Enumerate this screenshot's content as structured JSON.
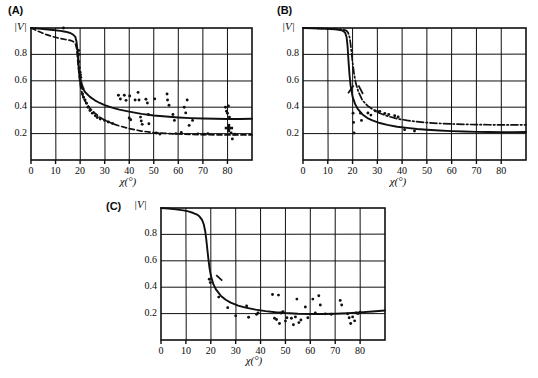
{
  "figure": {
    "background": "#ffffff",
    "ink": "#101010",
    "panels": [
      {
        "id": "A",
        "label": "(A)",
        "ylabel": "|V|",
        "xlabel": "χ(°)"
      },
      {
        "id": "B",
        "label": "(B)",
        "ylabel": "|V|",
        "xlabel": "χ(°)"
      },
      {
        "id": "C",
        "label": "(C)",
        "ylabel": "|V|",
        "xlabel": "χ(°)"
      }
    ]
  },
  "chart_data": [
    {
      "panel": "A",
      "type": "scatter",
      "title": "(A)",
      "xlabel": "χ(°)",
      "ylabel": "|V|",
      "xlim": [
        0,
        90
      ],
      "ylim": [
        0,
        1.0
      ],
      "xticks": [
        0,
        10,
        20,
        30,
        40,
        50,
        60,
        70,
        80
      ],
      "xticklabels": [
        "0",
        "10",
        "20",
        "30",
        "40",
        "50",
        "60",
        "70",
        "80"
      ],
      "yticks": [
        0.2,
        0.4,
        0.6,
        0.8
      ],
      "yticklabels": [
        "0.2",
        "0.4",
        "0.6",
        "0.8"
      ],
      "grid": true,
      "legend": "none",
      "series": [
        {
          "name": "solid-curve",
          "style": "solid",
          "x": [
            0,
            3,
            6,
            9,
            12,
            14,
            16,
            17,
            18,
            18.5,
            19,
            19.3,
            19.6,
            20,
            20.5,
            21,
            22,
            24,
            26,
            28,
            30,
            33,
            36,
            40,
            45,
            50,
            55,
            60,
            65,
            70,
            75,
            80,
            85,
            90
          ],
          "y": [
            1.0,
            0.995,
            0.99,
            0.985,
            0.978,
            0.972,
            0.962,
            0.952,
            0.935,
            0.9,
            0.82,
            0.74,
            0.66,
            0.6,
            0.565,
            0.545,
            0.515,
            0.478,
            0.452,
            0.432,
            0.416,
            0.397,
            0.382,
            0.366,
            0.349,
            0.337,
            0.329,
            0.322,
            0.317,
            0.314,
            0.312,
            0.311,
            0.311,
            0.312
          ]
        },
        {
          "name": "dashed-curve",
          "style": "dashed",
          "x": [
            0,
            3,
            6,
            9,
            12,
            14,
            16,
            17,
            18,
            18.6,
            19,
            19.4,
            19.8,
            20.2,
            21,
            22,
            24,
            26,
            28,
            30,
            33,
            36,
            40,
            45,
            50,
            55,
            60,
            65,
            70,
            75,
            80,
            85,
            90
          ],
          "y": [
            1.0,
            0.975,
            0.952,
            0.934,
            0.92,
            0.913,
            0.906,
            0.9,
            0.885,
            0.845,
            0.76,
            0.68,
            0.61,
            0.555,
            0.49,
            0.447,
            0.392,
            0.355,
            0.325,
            0.302,
            0.277,
            0.258,
            0.238,
            0.219,
            0.208,
            0.201,
            0.197,
            0.194,
            0.192,
            0.191,
            0.19,
            0.19,
            0.19
          ]
        },
        {
          "name": "scatter-points",
          "style": "points",
          "marker": "dot",
          "points": [
            [
              13.2,
              1.0
            ],
            [
              19.4,
              0.83
            ],
            [
              19.6,
              0.8
            ],
            [
              19.5,
              0.745
            ],
            [
              19.7,
              0.7
            ],
            [
              20.0,
              0.665
            ],
            [
              20.2,
              0.645
            ],
            [
              20.3,
              0.625
            ],
            [
              20.1,
              0.605
            ],
            [
              20.4,
              0.585
            ],
            [
              20.6,
              0.57
            ],
            [
              20.9,
              0.555
            ],
            [
              21.2,
              0.54
            ],
            [
              21.0,
              0.5
            ],
            [
              21.4,
              0.475
            ],
            [
              22.0,
              0.455
            ],
            [
              22.6,
              0.43
            ],
            [
              23.2,
              0.4
            ],
            [
              24.0,
              0.375
            ],
            [
              25.0,
              0.355
            ],
            [
              26.2,
              0.335
            ],
            [
              27.0,
              0.322
            ],
            [
              28.2,
              0.31
            ],
            [
              30.0,
              0.3
            ],
            [
              31.5,
              0.288
            ],
            [
              33.2,
              0.277
            ],
            [
              35.6,
              0.49
            ],
            [
              36.4,
              0.462
            ],
            [
              38.0,
              0.49
            ],
            [
              38.7,
              0.452
            ],
            [
              40.2,
              0.485
            ],
            [
              40.0,
              0.318
            ],
            [
              40.6,
              0.305
            ],
            [
              42.4,
              0.455
            ],
            [
              43.6,
              0.512
            ],
            [
              44.0,
              0.455
            ],
            [
              44.6,
              0.325
            ],
            [
              44.9,
              0.296
            ],
            [
              45.3,
              0.27
            ],
            [
              46.8,
              0.46
            ],
            [
              47.4,
              0.432
            ],
            [
              47.8,
              0.345
            ],
            [
              48.0,
              0.275
            ],
            [
              50.4,
              0.463
            ],
            [
              51.0,
              0.205
            ],
            [
              52.5,
              0.197
            ],
            [
              55.4,
              0.5
            ],
            [
              55.6,
              0.455
            ],
            [
              56.2,
              0.415
            ],
            [
              57.8,
              0.345
            ],
            [
              58.4,
              0.3
            ],
            [
              59.0,
              0.2
            ],
            [
              61.2,
              0.208
            ],
            [
              62.4,
              0.4
            ],
            [
              63.0,
              0.357
            ],
            [
              63.6,
              0.455
            ],
            [
              64.4,
              0.262
            ],
            [
              65.8,
              0.3
            ],
            [
              68.0,
              0.198
            ],
            [
              70.5,
              0.196
            ],
            [
              72.0,
              0.2
            ],
            [
              79.2,
              0.4
            ],
            [
              79.6,
              0.37
            ],
            [
              80.0,
              0.355
            ],
            [
              80.4,
              0.41
            ],
            [
              80.8,
              0.325
            ],
            [
              81.5,
              0.205
            ],
            [
              82.0,
              0.16
            ],
            [
              83.0,
              0.196
            ]
          ]
        },
        {
          "name": "plus-marker",
          "style": "points",
          "marker": "plus",
          "points": [
            [
              80.6,
              0.242
            ]
          ]
        }
      ]
    },
    {
      "panel": "B",
      "type": "scatter",
      "title": "(B)",
      "xlabel": "χ(°)",
      "ylabel": "|V|",
      "xlim": [
        0,
        90
      ],
      "ylim": [
        0,
        1.0
      ],
      "xticks": [
        0,
        10,
        20,
        30,
        40,
        50,
        60,
        70,
        80
      ],
      "xticklabels": [
        "0",
        "10",
        "20",
        "30",
        "40",
        "50",
        "60",
        "70",
        "80"
      ],
      "yticks": [
        0.2,
        0.4,
        0.6,
        0.8
      ],
      "yticklabels": [
        "0.2",
        "0.4",
        "0.6",
        "0.8"
      ],
      "grid": true,
      "legend": "none",
      "series": [
        {
          "name": "solid-curve",
          "style": "solid",
          "x": [
            0,
            4,
            8,
            11,
            13,
            15,
            16,
            17,
            17.6,
            18,
            18.4,
            18.8,
            19.2,
            20,
            21,
            22,
            24,
            26,
            28,
            31,
            34,
            38,
            42,
            46,
            50,
            55,
            60,
            65,
            70,
            75,
            80,
            85,
            90
          ],
          "y": [
            1.0,
            0.998,
            0.995,
            0.992,
            0.99,
            0.985,
            0.98,
            0.965,
            0.93,
            0.86,
            0.74,
            0.64,
            0.565,
            0.48,
            0.425,
            0.39,
            0.345,
            0.318,
            0.3,
            0.28,
            0.266,
            0.252,
            0.243,
            0.235,
            0.229,
            0.223,
            0.219,
            0.216,
            0.213,
            0.212,
            0.211,
            0.211,
            0.212
          ]
        },
        {
          "name": "dash-dot-curve",
          "style": "dashdot",
          "x": [
            0,
            4,
            8,
            11,
            13,
            15,
            16.5,
            17.5,
            18.2,
            18.8,
            19.2,
            19.6,
            20,
            20.6,
            21.4,
            22.4,
            24,
            26,
            28,
            31,
            34,
            38,
            42,
            46,
            50,
            55,
            60,
            65,
            70,
            75,
            80,
            85,
            90
          ],
          "y": [
            1.0,
            0.998,
            0.996,
            0.994,
            0.992,
            0.99,
            0.986,
            0.98,
            0.965,
            0.93,
            0.88,
            0.81,
            0.74,
            0.655,
            0.575,
            0.515,
            0.452,
            0.412,
            0.385,
            0.354,
            0.333,
            0.313,
            0.3,
            0.29,
            0.283,
            0.277,
            0.273,
            0.27,
            0.268,
            0.267,
            0.266,
            0.266,
            0.267
          ]
        },
        {
          "name": "tick-annotation-left",
          "style": "segment",
          "points": [
            [
              18.2,
              0.505
            ],
            [
              20.4,
              0.565
            ]
          ]
        },
        {
          "name": "tick-annotation-right",
          "style": "segment",
          "points": [
            [
              22.4,
              0.565
            ],
            [
              24.2,
              0.5
            ]
          ]
        },
        {
          "name": "scatter-points",
          "style": "points",
          "marker": "dot",
          "points": [
            [
              20.2,
              0.355
            ],
            [
              20.4,
              0.285
            ],
            [
              20.6,
              0.205
            ],
            [
              23.2,
              0.355
            ],
            [
              23.6,
              0.3
            ],
            [
              26.2,
              0.356
            ],
            [
              27.4,
              0.34
            ],
            [
              29.2,
              0.372
            ],
            [
              30.2,
              0.366
            ],
            [
              31.0,
              0.368
            ],
            [
              33.0,
              0.352
            ],
            [
              34.6,
              0.345
            ],
            [
              37.0,
              0.335
            ],
            [
              38.4,
              0.326
            ],
            [
              41.0,
              0.23
            ],
            [
              45.0,
              0.22
            ]
          ]
        }
      ]
    },
    {
      "panel": "C",
      "type": "scatter",
      "title": "(C)",
      "xlabel": "χ(°)",
      "ylabel": "|V|",
      "xlim": [
        0,
        90
      ],
      "ylim": [
        0,
        1.0
      ],
      "xticks": [
        0,
        10,
        20,
        30,
        40,
        50,
        60,
        70,
        80
      ],
      "xticklabels": [
        "0",
        "10",
        "20",
        "30",
        "40",
        "50",
        "60",
        "70",
        "80"
      ],
      "yticks": [
        0.2,
        0.4,
        0.6,
        0.8
      ],
      "yticklabels": [
        "0.2",
        "0.4",
        "0.6",
        "0.8"
      ],
      "grid": true,
      "legend": "none",
      "series": [
        {
          "name": "solid-curve",
          "style": "solid",
          "x": [
            0,
            3,
            6,
            9,
            11,
            13,
            14.5,
            15.5,
            16.5,
            17.2,
            17.8,
            18.2,
            18.6,
            19,
            19.5,
            20,
            21,
            22,
            24,
            26,
            28,
            31,
            34,
            38,
            42,
            46,
            50,
            55,
            60,
            65,
            70,
            75,
            80,
            85,
            90
          ],
          "y": [
            1.0,
            0.996,
            0.99,
            0.982,
            0.974,
            0.962,
            0.95,
            0.935,
            0.91,
            0.875,
            0.82,
            0.76,
            0.69,
            0.62,
            0.545,
            0.49,
            0.425,
            0.385,
            0.336,
            0.305,
            0.283,
            0.26,
            0.245,
            0.23,
            0.219,
            0.21,
            0.204,
            0.199,
            0.197,
            0.197,
            0.199,
            0.203,
            0.209,
            0.216,
            0.224
          ]
        },
        {
          "name": "tick-annotation",
          "style": "segment",
          "points": [
            [
              22.2,
              0.492
            ],
            [
              24.6,
              0.45
            ]
          ]
        },
        {
          "name": "scatter-points",
          "style": "points",
          "marker": "dot",
          "points": [
            [
              19.4,
              0.46
            ],
            [
              19.8,
              0.435
            ],
            [
              23.2,
              0.325
            ],
            [
              26.8,
              0.245
            ],
            [
              30.0,
              0.183
            ],
            [
              34.4,
              0.258
            ],
            [
              35.2,
              0.172
            ],
            [
              38.4,
              0.195
            ],
            [
              39.0,
              0.205
            ],
            [
              44.8,
              0.345
            ],
            [
              45.6,
              0.165
            ],
            [
              46.4,
              0.155
            ],
            [
              47.2,
              0.34
            ],
            [
              47.6,
              0.125
            ],
            [
              48.2,
              0.205
            ],
            [
              49.0,
              0.215
            ],
            [
              50.0,
              0.143
            ],
            [
              50.6,
              0.168
            ],
            [
              52.4,
              0.165
            ],
            [
              53.2,
              0.115
            ],
            [
              54.0,
              0.175
            ],
            [
              54.6,
              0.31
            ],
            [
              55.4,
              0.132
            ],
            [
              56.2,
              0.152
            ],
            [
              58.0,
              0.25
            ],
            [
              59.0,
              0.168
            ],
            [
              61.0,
              0.31
            ],
            [
              62.0,
              0.205
            ],
            [
              63.4,
              0.335
            ],
            [
              64.0,
              0.265
            ],
            [
              66.0,
              0.198
            ],
            [
              68.4,
              0.195
            ],
            [
              72.0,
              0.3
            ],
            [
              72.6,
              0.265
            ],
            [
              75.0,
              0.198
            ],
            [
              75.6,
              0.168
            ],
            [
              76.2,
              0.125
            ],
            [
              77.0,
              0.175
            ],
            [
              77.8,
              0.145
            ],
            [
              78.4,
              0.205
            ],
            [
              79.2,
              0.2
            ],
            [
              80.0,
              0.21
            ]
          ]
        }
      ]
    }
  ]
}
